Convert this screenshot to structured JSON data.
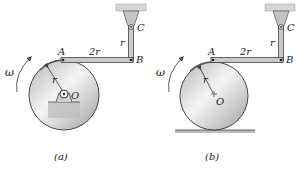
{
  "figures": [
    {
      "id": "a",
      "caption": "(a)",
      "labels": {
        "A": "A",
        "B": "B",
        "C": "C",
        "O": "O",
        "AB": "2r",
        "BC": "r",
        "radius": "r",
        "omega": "ω"
      },
      "support": "pinned base at O",
      "disk_center": [
        64,
        95
      ],
      "disk_radius": 35
    },
    {
      "id": "b",
      "caption": "(b)",
      "labels": {
        "A": "A",
        "B": "B",
        "C": "C",
        "O": "O",
        "AB": "2r",
        "BC": "r",
        "radius": "r",
        "omega": "ω"
      },
      "support": "rolling on ground",
      "disk_center": [
        214,
        96
      ],
      "disk_radius": 35
    }
  ],
  "colors": {
    "disk_light": "#f2f2f2",
    "disk_dark": "#a8a8a8",
    "link": "#c8c8c8",
    "outline": "#333333",
    "support": "#cfcfcf"
  }
}
